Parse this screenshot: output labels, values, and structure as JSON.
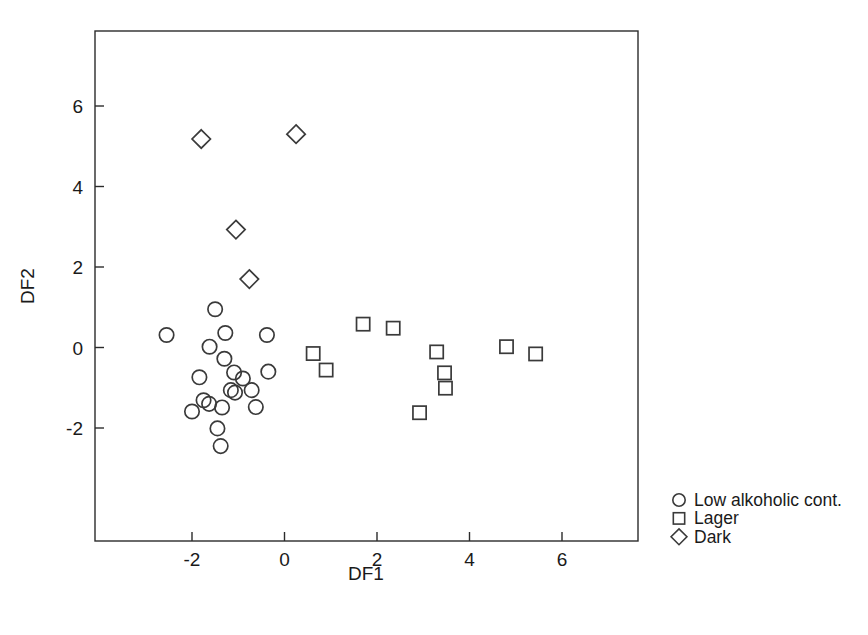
{
  "chart_data": {
    "type": "scatter",
    "title": "",
    "xlabel": "DF1",
    "ylabel": "DF2",
    "xlim": [
      -3.25,
      7.6
    ],
    "ylim": [
      -4.0,
      7.2
    ],
    "xticks": [
      -2,
      0,
      2,
      4,
      6
    ],
    "xtick_labels": [
      "-2",
      "0",
      "2",
      "4",
      "6"
    ],
    "yticks": [
      -2,
      0,
      2,
      4,
      6
    ],
    "ytick_labels": [
      "-2",
      "0",
      "2",
      "4",
      "6"
    ],
    "grid": false,
    "frame": "box",
    "legend_position": "outside-right-bottom",
    "series": [
      {
        "name": "Low alkoholic cont.",
        "marker": "circle",
        "color": "#3a3a3a",
        "points": [
          {
            "x": -2.55,
            "y": 0.31
          },
          {
            "x": -1.5,
            "y": 0.95
          },
          {
            "x": -1.62,
            "y": 0.02
          },
          {
            "x": -1.28,
            "y": 0.36
          },
          {
            "x": -0.38,
            "y": 0.31
          },
          {
            "x": -1.84,
            "y": -0.74
          },
          {
            "x": -1.3,
            "y": -0.28
          },
          {
            "x": -1.09,
            "y": -0.62
          },
          {
            "x": -0.9,
            "y": -0.77
          },
          {
            "x": -0.35,
            "y": -0.6
          },
          {
            "x": -1.75,
            "y": -1.31
          },
          {
            "x": -1.63,
            "y": -1.4
          },
          {
            "x": -1.16,
            "y": -1.06
          },
          {
            "x": -1.07,
            "y": -1.12
          },
          {
            "x": -0.71,
            "y": -1.06
          },
          {
            "x": -2.0,
            "y": -1.59
          },
          {
            "x": -1.35,
            "y": -1.49
          },
          {
            "x": -0.62,
            "y": -1.48
          },
          {
            "x": -1.45,
            "y": -2.01
          },
          {
            "x": -1.38,
            "y": -2.45
          }
        ]
      },
      {
        "name": "Lager",
        "marker": "square",
        "color": "#3a3a3a",
        "points": [
          {
            "x": 1.7,
            "y": 0.58
          },
          {
            "x": 2.35,
            "y": 0.48
          },
          {
            "x": 0.62,
            "y": -0.15
          },
          {
            "x": 0.9,
            "y": -0.56
          },
          {
            "x": 3.29,
            "y": -0.11
          },
          {
            "x": 3.46,
            "y": -0.63
          },
          {
            "x": 3.48,
            "y": -1.01
          },
          {
            "x": 4.8,
            "y": 0.02
          },
          {
            "x": 5.43,
            "y": -0.16
          },
          {
            "x": 2.92,
            "y": -1.62
          }
        ]
      },
      {
        "name": "Dark",
        "marker": "diamond",
        "color": "#3a3a3a",
        "points": [
          {
            "x": -1.8,
            "y": 5.18
          },
          {
            "x": 0.25,
            "y": 5.3
          },
          {
            "x": -1.05,
            "y": 2.93
          },
          {
            "x": -0.76,
            "y": 1.7
          }
        ]
      }
    ]
  },
  "legend": {
    "entries": [
      {
        "label": "Low alkoholic cont.",
        "marker": "circle"
      },
      {
        "label": "Lager",
        "marker": "square"
      },
      {
        "label": "Dark",
        "marker": "diamond"
      }
    ]
  }
}
